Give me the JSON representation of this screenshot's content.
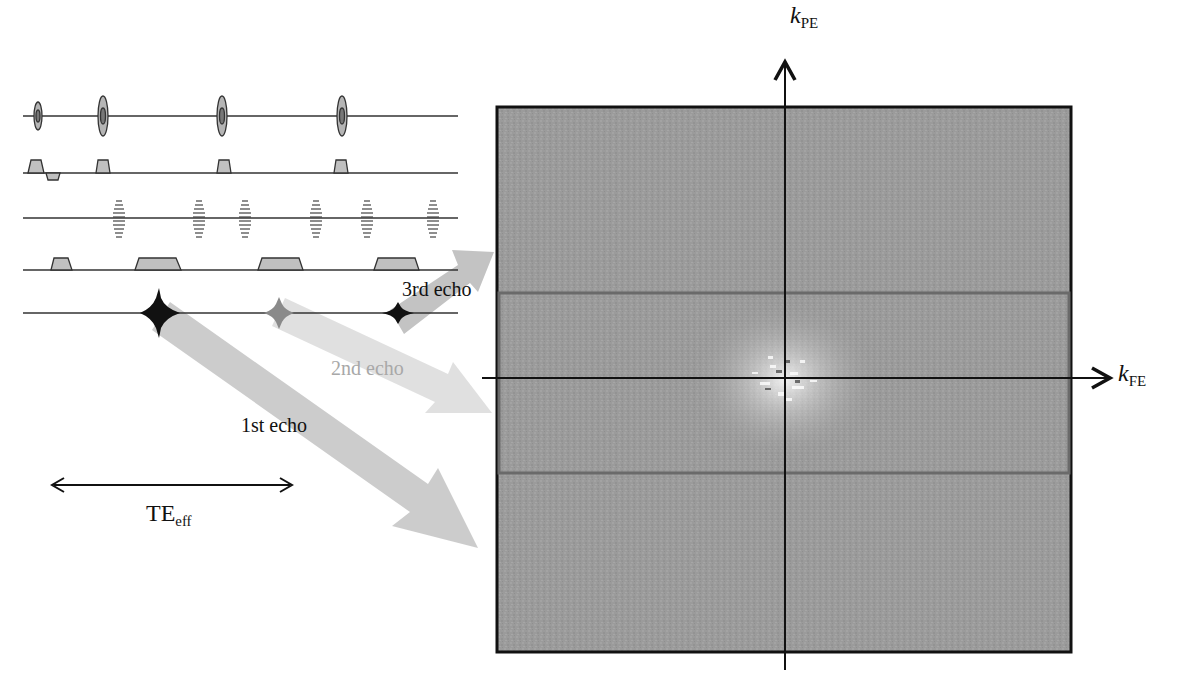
{
  "figure": {
    "kspace": {
      "axis_vertical_label": "k",
      "axis_vertical_sub": "PE",
      "axis_horizontal_label": "k",
      "axis_horizontal_sub": "FE",
      "box": {
        "x": 497,
        "y": 107,
        "w": 574,
        "h": 545
      },
      "center_band": {
        "y_top": 293,
        "y_bottom": 473
      },
      "colors": {
        "fill": "#9a9a9a",
        "border": "#111111",
        "band_border": "#6a6a6a"
      }
    },
    "sequence_rows": [
      {
        "name": "rf",
        "type": "rf-pulses"
      },
      {
        "name": "slice-select",
        "type": "gradient"
      },
      {
        "name": "phase-encode",
        "type": "phase-blips"
      },
      {
        "name": "frequency-encode",
        "type": "readout-gradient"
      },
      {
        "name": "signal",
        "type": "echoes"
      }
    ],
    "echoes": [
      {
        "label": "1st echo",
        "color": "#111111",
        "arrow_color": "#c8c8c8"
      },
      {
        "label": "2nd echo",
        "color": "#b0b0b0",
        "arrow_color": "#dcdcdc"
      },
      {
        "label": "3rd echo",
        "color": "#111111",
        "arrow_color": "#bdbdbd"
      }
    ],
    "te": {
      "label": "TE",
      "sub": "eff"
    }
  }
}
